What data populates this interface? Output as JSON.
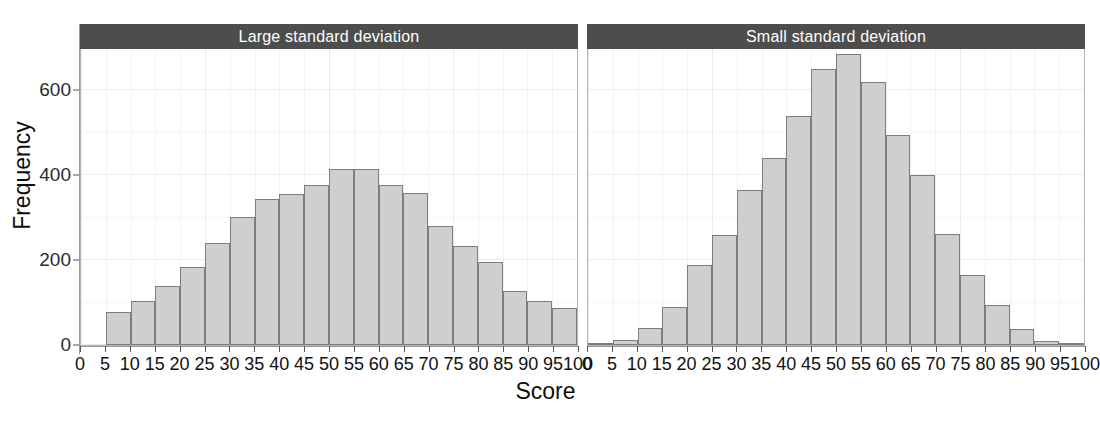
{
  "figure": {
    "ylabel": "Frequency",
    "xlabel": "Score",
    "strip_color": "#4d4d4d",
    "bar_fill": "#cfcfcf",
    "bar_border": "#7d7d7d"
  },
  "chart_data": {
    "type": "bar",
    "title": "",
    "xlabel": "Score",
    "ylabel": "Frequency",
    "xlim": [
      0,
      100
    ],
    "ylim": [
      0,
      700
    ],
    "xticks": [
      0,
      5,
      10,
      15,
      20,
      25,
      30,
      35,
      40,
      45,
      50,
      55,
      60,
      65,
      70,
      75,
      80,
      85,
      90,
      95,
      100
    ],
    "yticks": [
      0,
      200,
      400,
      600
    ],
    "grid": true,
    "legend": "none",
    "facets": [
      {
        "label": "Large standard deviation",
        "bin_width": 5,
        "bin_starts": [
          5,
          10,
          15,
          20,
          25,
          30,
          35,
          40,
          45,
          50,
          55,
          60,
          65,
          70,
          75,
          80,
          85,
          90,
          95
        ],
        "values": [
          78,
          103,
          140,
          185,
          240,
          302,
          345,
          357,
          378,
          415,
          415,
          378,
          358,
          280,
          233,
          195,
          128,
          103,
          88
        ]
      },
      {
        "label": "Small standard deviation",
        "bin_width": 5,
        "bin_starts": [
          0,
          5,
          10,
          15,
          20,
          25,
          30,
          35,
          40,
          45,
          50,
          55,
          60,
          65,
          70,
          75,
          80,
          85,
          90,
          95
        ],
        "values": [
          5,
          12,
          40,
          90,
          188,
          260,
          365,
          440,
          540,
          650,
          685,
          620,
          495,
          400,
          262,
          165,
          95,
          38,
          10,
          2
        ]
      }
    ]
  }
}
